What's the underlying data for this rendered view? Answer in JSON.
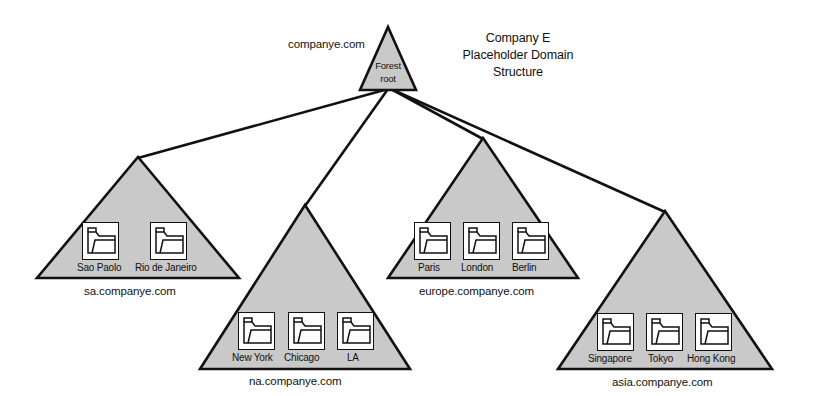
{
  "diagram": {
    "title_lines": [
      "Company E",
      "Placeholder Domain",
      "Structure"
    ],
    "root": {
      "domain": "companye.com",
      "caption_line1": "Forest",
      "caption_line2": "root"
    },
    "children": [
      {
        "id": "sa",
        "domain": "sa.companye.com",
        "sites": [
          "Sao Paolo",
          "Rio de Janeiro"
        ]
      },
      {
        "id": "na",
        "domain": "na.companye.com",
        "sites": [
          "New York",
          "Chicago",
          "LA"
        ]
      },
      {
        "id": "europe",
        "domain": "europe.companye.com",
        "sites": [
          "Paris",
          "London",
          "Berlin"
        ]
      },
      {
        "id": "asia",
        "domain": "asia.companye.com",
        "sites": [
          "Singapore",
          "Tokyo",
          "Hong Kong"
        ]
      }
    ],
    "colors": {
      "triangle_fill": "#c9c9c9",
      "triangle_stroke": "#111111",
      "folder_fill": "#ffffff",
      "text": "#111111",
      "background": "#ffffff"
    },
    "icon_names": [
      "folder-icon"
    ]
  }
}
